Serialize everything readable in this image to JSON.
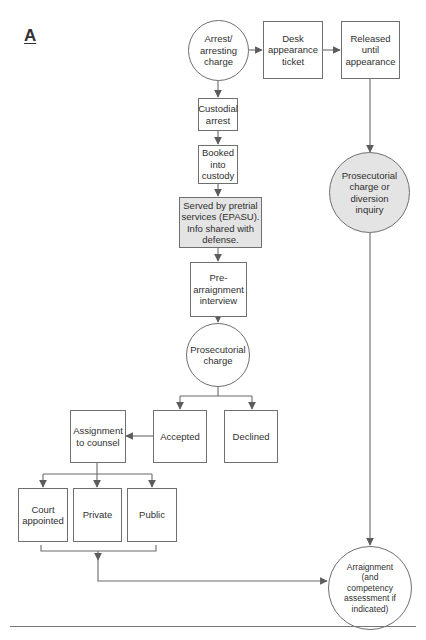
{
  "panel_label": "A",
  "nodes": {
    "arrest": {
      "label": "Arrest/\narresting\ncharge",
      "shape": "circle"
    },
    "desk_ticket": {
      "label": "Desk\nappearance\nticket",
      "shape": "box"
    },
    "released": {
      "label": "Released\nuntil\nappearance",
      "shape": "box"
    },
    "diversion": {
      "label": "Prosecutorial\ncharge or\ndiversion\ninquiry",
      "shape": "circle",
      "shaded": true
    },
    "custodial": {
      "label": "Custodial\narrest",
      "shape": "box"
    },
    "booked": {
      "label": "Booked\ninto\ncustody",
      "shape": "box"
    },
    "pretrial": {
      "label": "Served by pretrial\nservices (EPASU).\nInfo shared with\ndefense.",
      "shape": "box",
      "shaded": true
    },
    "pre_arraignment": {
      "label": "Pre-\narraignment\ninterview",
      "shape": "box"
    },
    "prosecutorial": {
      "label": "Prosecutorial\ncharge",
      "shape": "circle"
    },
    "accepted": {
      "label": "Accepted",
      "shape": "box"
    },
    "declined": {
      "label": "Declined",
      "shape": "box"
    },
    "assignment": {
      "label": "Assignment\nto counsel",
      "shape": "box"
    },
    "court_appointed": {
      "label": "Court\nappointed",
      "shape": "box"
    },
    "private": {
      "label": "Private",
      "shape": "box"
    },
    "public": {
      "label": "Public",
      "shape": "box"
    },
    "arraignment": {
      "label": "Arraignment\n(and\ncompetency\nassessment if\nindicated)",
      "shape": "circle"
    }
  },
  "edges": [
    {
      "from": "arrest",
      "to": "desk_ticket"
    },
    {
      "from": "desk_ticket",
      "to": "released"
    },
    {
      "from": "released",
      "to": "diversion"
    },
    {
      "from": "diversion",
      "to": "arraignment"
    },
    {
      "from": "arrest",
      "to": "custodial"
    },
    {
      "from": "custodial",
      "to": "booked"
    },
    {
      "from": "booked",
      "to": "pretrial"
    },
    {
      "from": "pretrial",
      "to": "pre_arraignment"
    },
    {
      "from": "pre_arraignment",
      "to": "prosecutorial"
    },
    {
      "from": "prosecutorial",
      "to": "accepted"
    },
    {
      "from": "prosecutorial",
      "to": "declined"
    },
    {
      "from": "accepted",
      "to": "assignment"
    },
    {
      "from": "assignment",
      "to": "court_appointed"
    },
    {
      "from": "assignment",
      "to": "private"
    },
    {
      "from": "assignment",
      "to": "public"
    },
    {
      "from": "counsel_group",
      "to": "arraignment"
    }
  ],
  "colors": {
    "stroke": "#6f6f6f",
    "shaded_fill": "#e4e4e4",
    "background": "#ffffff"
  }
}
